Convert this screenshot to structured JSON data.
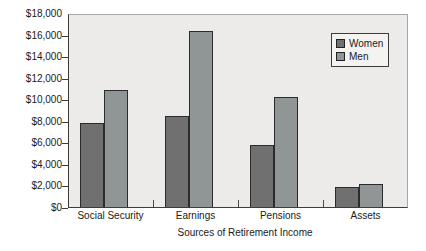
{
  "chart_data": {
    "type": "bar",
    "title": "",
    "xlabel": "Sources of Retirement Income",
    "ylabel": "",
    "categories": [
      "Social Security",
      "Earnings",
      "Pensions",
      "Assets"
    ],
    "series": [
      {
        "name": "Women",
        "color": "#707070",
        "values": [
          7900,
          8500,
          5800,
          1900
        ]
      },
      {
        "name": "Men",
        "color": "#909596",
        "values": [
          11000,
          16500,
          10300,
          2200
        ]
      }
    ],
    "ylim": [
      0,
      18000
    ],
    "y_ticks": [
      {
        "value": 18000,
        "label": "$18,000"
      },
      {
        "value": 16000,
        "label": "$16,000"
      },
      {
        "value": 14000,
        "label": "$14,000"
      },
      {
        "value": 12000,
        "label": "$12,000"
      },
      {
        "value": 10000,
        "label": "$10,000"
      },
      {
        "value": 8000,
        "label": "$8,000"
      },
      {
        "value": 6000,
        "label": "$6,000"
      },
      {
        "value": 4000,
        "label": "$4,000"
      },
      {
        "value": 2000,
        "label": "$2,000"
      },
      {
        "value": 0,
        "label": "$0"
      }
    ],
    "grid": false,
    "legend_position": "top-right",
    "plot_background": "#ecebe9",
    "bar_border_color": "#2b2b2b"
  }
}
